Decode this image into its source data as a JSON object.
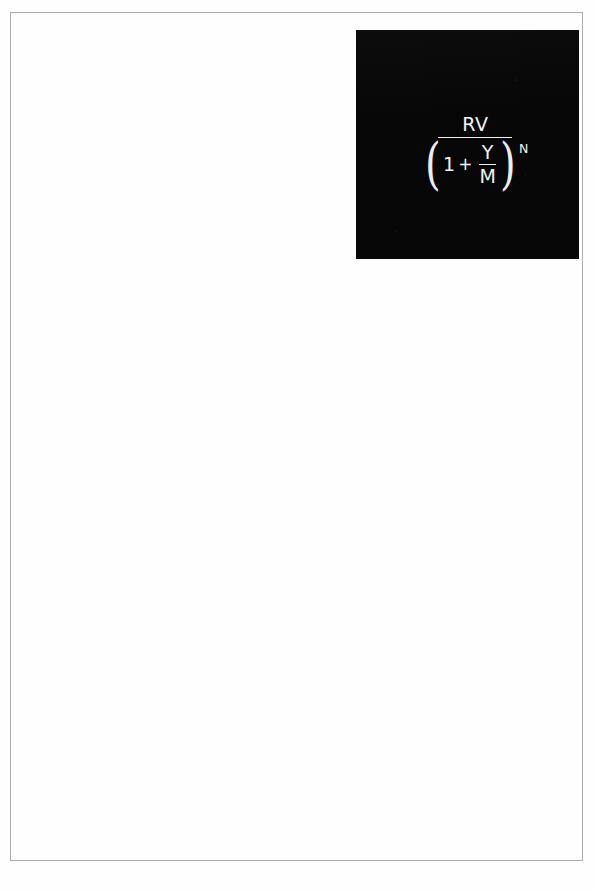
{
  "page": {
    "label": "Scanned document page",
    "background_color": "#ffffff",
    "border_color": "#a9abad"
  },
  "formula_plate": {
    "label": "Present value discount factor formula",
    "background_color": "#070707",
    "text_color": "#f2f2f2",
    "expression_plain": "RV / (1 + Y/M)^N",
    "outer_fraction": {
      "numerator": "RV",
      "denominator": {
        "open_paren": "(",
        "first_term": "1",
        "operator": "+",
        "inner_fraction": {
          "numerator": "Y",
          "denominator": "M"
        },
        "close_paren": ")",
        "exponent": "N"
      }
    }
  }
}
